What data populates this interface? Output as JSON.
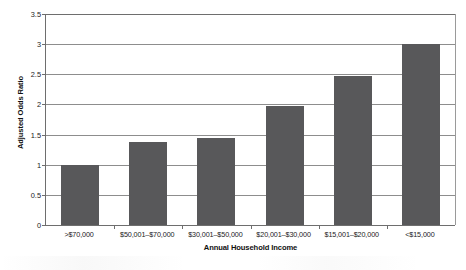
{
  "chart_data": {
    "type": "bar",
    "title": "",
    "subtitle": "",
    "xlabel": "Annual Household Income",
    "ylabel": "Adjusted Odds Ratio",
    "categories": [
      ">$70,000",
      "$50,001–$70,000",
      "$30,001–$50,000",
      "$20,001–$30,000",
      "$15,001–$20,000",
      "<$15,000"
    ],
    "values": [
      1.0,
      1.38,
      1.45,
      1.98,
      2.47,
      3.0
    ],
    "ylim": [
      0,
      3.5
    ],
    "yticks": [
      0,
      0.5,
      1,
      1.5,
      2,
      2.5,
      3,
      3.5
    ],
    "ytick_labels": [
      "0",
      "0.5",
      "1",
      "1.5",
      "2",
      "2.5",
      "3",
      "3.5"
    ],
    "grid": true,
    "grid_axis": "y",
    "legend": false,
    "legend_position": "none",
    "bar_color": "#58585a",
    "axis_color": "#6e6e6e",
    "grid_color": "#8d8d8d",
    "background_color": "#ffffff"
  }
}
